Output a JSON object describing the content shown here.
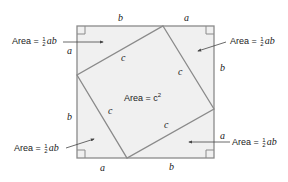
{
  "diagram": {
    "outer_square": {
      "x1": 77,
      "y1": 26,
      "x2": 214,
      "y2": 158,
      "fill": "#f0f0f0",
      "stroke": "#8a8a8a"
    },
    "inner_square": {
      "points": "163,26 214,109 127,158 77,75",
      "stroke": "#8a8a8a"
    },
    "outer_side_labels": {
      "top_left": "b",
      "top_right": "a",
      "right_top": "b",
      "right_bottom": "a",
      "bottom_right": "b",
      "bottom_left": "a",
      "left_bottom": "b",
      "left_top": "a"
    },
    "inner_side_labels": [
      "c",
      "c",
      "c",
      "c"
    ],
    "center_label": {
      "text": "Area = c",
      "exponent": "2"
    },
    "triangle_area_labels": [
      {
        "id": "top-left",
        "prefix": "Area =",
        "num": "1",
        "den": "2",
        "suffix": "ab"
      },
      {
        "id": "top-right",
        "prefix": "Area =",
        "num": "1",
        "den": "2",
        "suffix": "ab"
      },
      {
        "id": "bottom-left",
        "prefix": "Area =",
        "num": "1",
        "den": "2",
        "suffix": "ab"
      },
      {
        "id": "bottom-right",
        "prefix": "Area =",
        "num": "1",
        "den": "2",
        "suffix": "ab"
      }
    ]
  }
}
